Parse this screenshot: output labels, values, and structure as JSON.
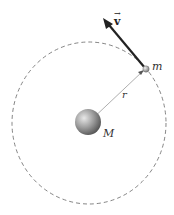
{
  "diagram": {
    "type": "circular-orbit",
    "labels": {
      "velocity": "v",
      "velocity_arrow": "→",
      "orbiting_mass": "m",
      "radius": "r",
      "central_mass": "M"
    },
    "colors": {
      "orbit": "#555555",
      "velocity_vector": "#222222",
      "radius_line": "#888888",
      "central_mass": "#8a8a8a",
      "orbiting_mass": "#9a9a9a"
    }
  }
}
